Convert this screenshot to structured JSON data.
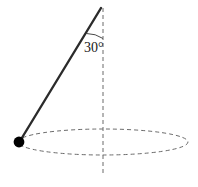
{
  "figure": {
    "name": "conical-pendulum-diagram",
    "background_color": "#ffffff",
    "width": 198,
    "height": 187,
    "angle_label": "30°",
    "colors": {
      "rod": "#2b2b2b",
      "bob": "#000000",
      "dashed": "#6b6b6b",
      "arc": "#4a4a4a",
      "text": "#1a1a1a"
    },
    "rod": {
      "label": "pendulum-rod",
      "x1": 101,
      "y1": 8,
      "x2": 20,
      "y2": 141,
      "stroke_width": 2.4
    },
    "bob": {
      "label": "pendulum-bob",
      "cx": 19,
      "cy": 142,
      "r": 5.4
    },
    "axis": {
      "label": "vertical-axis",
      "x": 103,
      "y_top": 8,
      "y_bottom": 176,
      "dash": "4 3"
    },
    "circle_path": {
      "label": "orbit-ellipse",
      "cx": 103,
      "cy": 142,
      "rx": 85,
      "ry": 13,
      "dash": "4 3"
    },
    "angle_arc": {
      "label": "angle-arc",
      "path": "M 86.5,33.5 A 30 30 0 0 1 103,38.5"
    },
    "angle_text_pos": {
      "x": 84,
      "y": 52
    }
  }
}
